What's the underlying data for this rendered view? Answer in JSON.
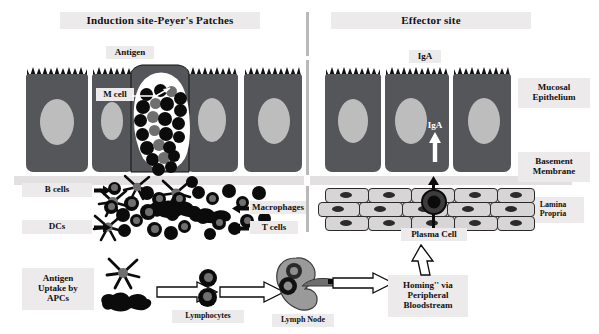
{
  "figure": {
    "title_left": "Induction site-Peyer's Patches",
    "title_right": "Effector site"
  },
  "headers": [
    {
      "id": "induction-site",
      "label": "Induction site-Peyer's Patches"
    },
    {
      "id": "effector-site",
      "label": "Effector site"
    }
  ],
  "labels": {
    "antigen": "Antigen",
    "m_cell": "M cell",
    "iga_lumen": "IgA",
    "iga_transcytosis": "IgA",
    "mucosal_epithelium": "Mucosal\nEpithelium",
    "basement_membrane": "Basement\nMembrane",
    "lamina_propria": "Lamina\nPropria",
    "b_cells": "B cells",
    "dcs": "DCs",
    "macrophages": "Macrophages",
    "t_cells": "T cells",
    "antigen_uptake": "Antigen\nUptake by\nAPCs",
    "lymphocytes": "Lymphocytes",
    "lymph_node": "Lymph Node",
    "plasma_cell": "Plasma Cell",
    "homing": "Homing'' via\nPeripheral\nBloodstream"
  },
  "colors": {
    "background": "#ffffff",
    "label_chip": "#eceaea",
    "epithelium_body": "#55565a",
    "epithelium_nucleus": "#bdbdbd",
    "basement_membrane": "#e2e0e0",
    "lamina_cell_body": "#d7d5d5",
    "lamina_cell_nucleus": "#2b2b2b",
    "immune_cell_dark": "#0b0b0b",
    "immune_cell_gray": "#6f6f6f",
    "divider": "#b9b9b9",
    "outline": "#111111"
  },
  "icons": {
    "dendritic_cell": "dendritic-cell-icon",
    "macrophage": "macrophage-icon",
    "lymph_node": "lymph-node-icon",
    "m_cell_pocket": "m-cell-pocket-icon",
    "plasma_cell": "plasma-cell-icon",
    "hollow_arrow": "hollow-arrow-icon",
    "solid_arrow": "solid-arrow-icon",
    "white_up_arrow": "white-up-arrow-icon",
    "brush_border": "microvilli-brush-border-icon"
  },
  "structure": {
    "epithelial_cells_left": 4,
    "epithelial_cells_right": 3,
    "lamina_propria_rows": 3,
    "sections": [
      "induction site",
      "effector site"
    ]
  }
}
